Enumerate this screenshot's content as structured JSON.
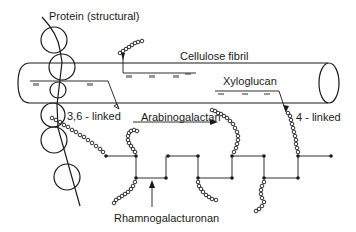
{
  "diagram": {
    "labels": {
      "protein": "Protein  (structural)",
      "cellulose": "Cellulose fibril",
      "xyloglucan": "Xyloglucan",
      "linked_36": "3,6 - linked",
      "arabinogalactan": "Arabinogalactan",
      "linked_4": "4 - linked",
      "rhamnogalacturonan": "Rhamnogalacturonan"
    },
    "components": [
      "Protein (structural)",
      "Cellulose fibril",
      "Xyloglucan",
      "Arabinogalactan",
      "Rhamnogalacturonan"
    ],
    "linkages": [
      "3,6 - linked",
      "4 - linked"
    ],
    "colors": {
      "ink": "#1a1a1a",
      "background": "#ffffff"
    }
  }
}
